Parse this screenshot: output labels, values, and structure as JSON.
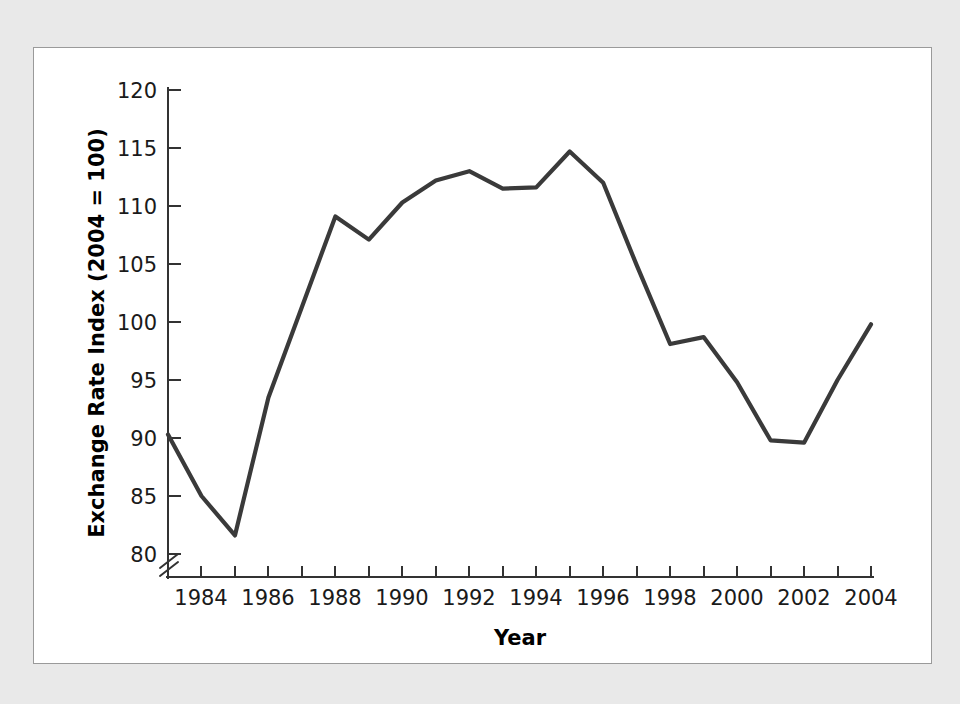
{
  "chart_data": {
    "type": "line",
    "title": "",
    "subtitle": "",
    "xlabel": "Year",
    "ylabel": "Exchange Rate Index (2004 = 100)",
    "x": [
      1983,
      1984,
      1985,
      1986,
      1987,
      1988,
      1989,
      1990,
      1991,
      1992,
      1993,
      1994,
      1995,
      1996,
      1997,
      1998,
      1999,
      2000,
      2001,
      2002,
      2003,
      2004
    ],
    "values": [
      90.3,
      85.0,
      81.6,
      93.5,
      101.3,
      109.1,
      107.1,
      110.3,
      112.2,
      113.0,
      111.5,
      111.6,
      114.7,
      112.0,
      104.9,
      98.1,
      98.7,
      94.8,
      89.8,
      89.6,
      95.0,
      99.8
    ],
    "series": [
      {
        "name": "Exchange Rate Index",
        "values": [
          90.3,
          85.0,
          81.6,
          93.5,
          101.3,
          109.1,
          107.1,
          110.3,
          112.2,
          113.0,
          111.5,
          111.6,
          114.7,
          112.0,
          104.9,
          98.1,
          98.7,
          94.8,
          89.8,
          89.6,
          95.0,
          99.8
        ]
      }
    ],
    "xlim": [
      1983,
      2004
    ],
    "ylim": [
      80,
      120
    ],
    "y_ticks": [
      80,
      85,
      90,
      95,
      100,
      105,
      110,
      115,
      120
    ],
    "y_tick_labels": [
      "80",
      "85",
      "90",
      "95",
      "100",
      "105",
      "110",
      "115",
      "120"
    ],
    "x_ticks": [
      1984,
      1985,
      1986,
      1987,
      1988,
      1989,
      1990,
      1991,
      1992,
      1993,
      1994,
      1995,
      1996,
      1997,
      1998,
      1999,
      2000,
      2001,
      2002,
      2003,
      2004
    ],
    "x_tick_labels": [
      "1984",
      "1986",
      "1988",
      "1990",
      "1992",
      "1994",
      "1996",
      "1998",
      "2000",
      "2002",
      "2004"
    ],
    "x_labeled_ticks": [
      1984,
      1986,
      1988,
      1990,
      1992,
      1994,
      1996,
      1998,
      2000,
      2002,
      2004
    ],
    "grid": false,
    "legend": false,
    "legend_position": "none",
    "axis_break": true,
    "axis_break_note": "y-axis break below 80",
    "line_color": "#3a3a3a",
    "axis_color": "#333333",
    "panel_background": "#ffffff",
    "figure_background": "#e9e9e9"
  },
  "axes": {
    "y_title": "Exchange Rate Index (2004 = 100)",
    "x_title": "Year"
  }
}
